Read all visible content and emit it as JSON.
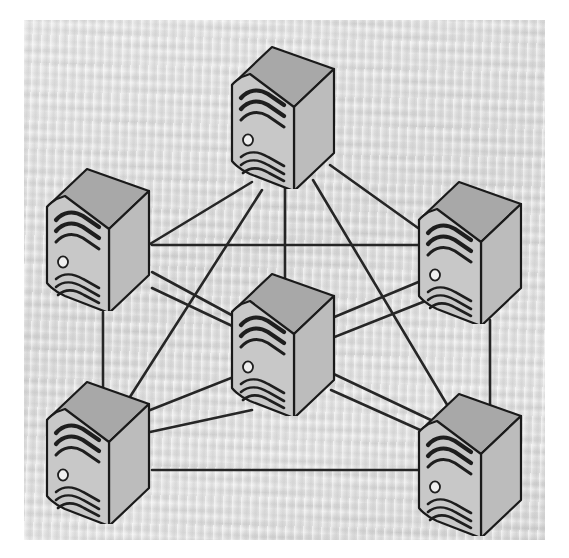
{
  "figure": {
    "kind": "network-topology-diagram",
    "background_color": "#dfdfdf",
    "paper_color": "#ffffff",
    "link_color": "#262626",
    "node_outline_color": "#1a1a1a"
  },
  "palette": {
    "top_face": "#a8a8a8",
    "front_face": "#c8c8c8",
    "side_face": "#bdbdbd",
    "vent_dark": "#1e1e1e",
    "power_led": "#efefef"
  },
  "nodes": [
    {
      "id": "top",
      "label": "Server Top",
      "icon": "server-tower-icon",
      "x": 283,
      "y": 115,
      "scale": 1.0,
      "link_x": 285,
      "link_y": 186
    },
    {
      "id": "left",
      "label": "Server Left",
      "icon": "server-tower-icon",
      "x": 98,
      "y": 237,
      "scale": 1.0,
      "link_x": 100,
      "link_y": 308
    },
    {
      "id": "right",
      "label": "Server Right",
      "icon": "server-tower-icon",
      "x": 470,
      "y": 250,
      "scale": 1.0,
      "link_x": 468,
      "link_y": 322
    },
    {
      "id": "center",
      "label": "Server Center",
      "icon": "server-tower-icon",
      "x": 283,
      "y": 342,
      "scale": 1.0,
      "link_x": 285,
      "link_y": 412
    },
    {
      "id": "bottom-left",
      "label": "Server Bottom Left",
      "icon": "server-tower-icon",
      "x": 98,
      "y": 450,
      "scale": 1.0,
      "link_x": 100,
      "link_y": 520
    },
    {
      "id": "bottom-right",
      "label": "Server Bottom Right",
      "icon": "server-tower-icon",
      "x": 470,
      "y": 462,
      "scale": 1.0,
      "link_x": 468,
      "link_y": 533
    }
  ],
  "links": [
    {
      "id": "top-left",
      "from": "top",
      "to": "left",
      "x1": 252,
      "y1": 182,
      "x2": 145,
      "y2": 247
    },
    {
      "id": "top-right",
      "from": "top",
      "to": "right",
      "x1": 330,
      "y1": 165,
      "x2": 432,
      "y2": 238
    },
    {
      "id": "top-center",
      "from": "top",
      "to": "center",
      "x1": 285,
      "y1": 186,
      "x2": 285,
      "y2": 305
    },
    {
      "id": "top-bottom-left",
      "from": "top",
      "to": "bottom-left",
      "x1": 262,
      "y1": 190,
      "x2": 128,
      "y2": 400
    },
    {
      "id": "top-bottom-right",
      "from": "top",
      "to": "bottom-right",
      "x1": 313,
      "y1": 180,
      "x2": 455,
      "y2": 418
    },
    {
      "id": "left-right",
      "from": "left",
      "to": "right",
      "x1": 152,
      "y1": 245,
      "x2": 430,
      "y2": 245
    },
    {
      "id": "left-bottom-left",
      "from": "left",
      "to": "bottom-left",
      "x1": 103,
      "y1": 312,
      "x2": 103,
      "y2": 392
    },
    {
      "id": "left-center",
      "from": "left",
      "to": "center",
      "x1": 152,
      "y1": 272,
      "x2": 250,
      "y2": 325
    },
    {
      "id": "left-bottom-right",
      "from": "left",
      "to": "bottom-right",
      "x1": 152,
      "y1": 288,
      "x2": 452,
      "y2": 430
    },
    {
      "id": "right-center",
      "from": "right",
      "to": "center",
      "x1": 428,
      "y1": 278,
      "x2": 332,
      "y2": 318
    },
    {
      "id": "right-bottom-right",
      "from": "right",
      "to": "bottom-right",
      "x1": 490,
      "y1": 320,
      "x2": 490,
      "y2": 405
    },
    {
      "id": "right-bottom-left",
      "from": "right",
      "to": "bottom-left",
      "x1": 428,
      "y1": 300,
      "x2": 130,
      "y2": 418
    },
    {
      "id": "center-bottom-left",
      "from": "center",
      "to": "bottom-left",
      "x1": 252,
      "y1": 410,
      "x2": 150,
      "y2": 432
    },
    {
      "id": "center-bottom-right",
      "from": "center",
      "to": "bottom-right",
      "x1": 331,
      "y1": 390,
      "x2": 438,
      "y2": 438
    },
    {
      "id": "bottomleft-bottomright",
      "from": "bottom-left",
      "to": "bottom-right",
      "x1": 152,
      "y1": 470,
      "x2": 432,
      "y2": 470
    }
  ],
  "geometry": {
    "node_width": 118,
    "node_height": 148,
    "front_width": 62,
    "side_width": 56,
    "top_depth": 38,
    "vent_rows_top": 3,
    "vent_rows_bottom": 3
  }
}
